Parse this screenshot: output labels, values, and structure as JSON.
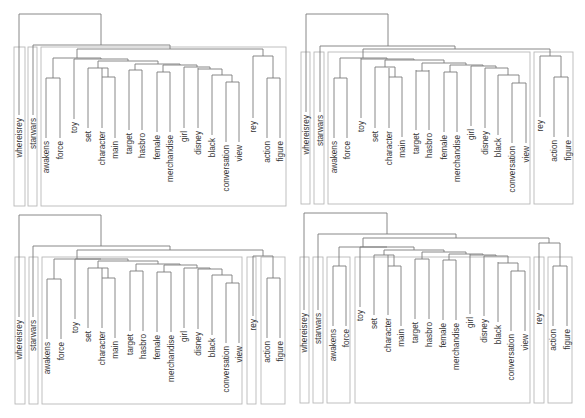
{
  "leaves": [
    "whereisrey",
    "starwars",
    "awakens",
    "force",
    "toy",
    "set",
    "character",
    "main",
    "target",
    "hasbro",
    "female",
    "merchandise",
    "girl",
    "disney",
    "black",
    "conversation",
    "view",
    "rey",
    "action",
    "figure"
  ],
  "colors": {
    "line": "#7a7a7a",
    "box": "#b8b8b8",
    "text": "#333333",
    "background": "#ffffff"
  },
  "panels": [
    {
      "id": "top-left",
      "origin": [
        0,
        0
      ],
      "leaf_x": [
        19,
        33,
        46,
        60,
        74,
        88,
        102,
        115,
        129,
        142,
        157,
        170,
        184,
        198,
        212,
        226,
        239,
        253,
        267,
        280
      ],
      "leaf_label_top": [
        55,
        55,
        78,
        78,
        78,
        78,
        78,
        78,
        78,
        78,
        78,
        78,
        78,
        78,
        78,
        78,
        78,
        78,
        78,
        78
      ],
      "leaf_line_top": [
        55,
        55,
        78,
        78,
        59,
        68,
        68,
        78,
        70,
        70,
        72,
        72,
        68,
        68,
        75,
        82,
        82,
        58,
        78,
        78
      ],
      "merges": [
        {
          "x1": 46,
          "x2": 60,
          "y": 78,
          "cx": 53
        },
        {
          "x1": 102,
          "x2": 115,
          "y": 77,
          "cx": 108
        },
        {
          "x1": 88,
          "x2": 108,
          "y": 68,
          "cx": 98
        },
        {
          "x1": 129,
          "x2": 142,
          "y": 70,
          "cx": 135
        },
        {
          "x1": 157,
          "x2": 170,
          "y": 72,
          "cx": 163
        },
        {
          "x1": 226,
          "x2": 239,
          "y": 82,
          "cx": 232
        },
        {
          "x1": 212,
          "x2": 232,
          "y": 75,
          "cx": 222
        },
        {
          "x1": 198,
          "x2": 222,
          "y": 69,
          "cx": 210
        },
        {
          "x1": 184,
          "x2": 210,
          "y": 67,
          "cx": 197
        },
        {
          "x1": 163,
          "x2": 197,
          "y": 65,
          "cx": 180
        },
        {
          "x1": 135,
          "x2": 180,
          "y": 64,
          "cx": 158
        },
        {
          "x1": 98,
          "x2": 158,
          "y": 61,
          "cx": 128
        },
        {
          "x1": 74,
          "x2": 128,
          "y": 59,
          "cx": 101
        },
        {
          "x1": 53,
          "x2": 101,
          "y": 58,
          "cx": 77
        },
        {
          "x1": 267,
          "x2": 280,
          "y": 78,
          "cx": 273
        },
        {
          "x1": 253,
          "x2": 273,
          "y": 56,
          "cx": 263
        },
        {
          "x1": 77,
          "x2": 263,
          "y": 49,
          "cx": 170
        },
        {
          "x1": 33,
          "x2": 170,
          "y": 45,
          "cx": 101
        },
        {
          "x1": 19,
          "x2": 101,
          "y": 14,
          "cx": 60
        }
      ],
      "boxes": [
        [
          14,
          47,
          25,
          206
        ],
        [
          28,
          47,
          37,
          206
        ],
        [
          41,
          47,
          286,
          206
        ]
      ]
    },
    {
      "id": "top-right",
      "origin": [
        295,
        0
      ],
      "leaf_x": [
        11,
        25,
        39,
        52,
        66,
        80,
        94,
        107,
        121,
        134,
        149,
        162,
        176,
        190,
        203,
        217,
        231,
        245,
        259,
        273
      ],
      "leaf_line_top": [
        52,
        52,
        78,
        78,
        58,
        68,
        68,
        77,
        70,
        70,
        72,
        72,
        66,
        68,
        75,
        83,
        83,
        57,
        77,
        77
      ],
      "merges": [
        {
          "x1": 39,
          "x2": 52,
          "y": 78,
          "cx": 45
        },
        {
          "x1": 94,
          "x2": 107,
          "y": 77,
          "cx": 100
        },
        {
          "x1": 80,
          "x2": 100,
          "y": 67,
          "cx": 90
        },
        {
          "x1": 121,
          "x2": 134,
          "y": 71,
          "cx": 127
        },
        {
          "x1": 149,
          "x2": 162,
          "y": 72,
          "cx": 155
        },
        {
          "x1": 217,
          "x2": 231,
          "y": 83,
          "cx": 224
        },
        {
          "x1": 203,
          "x2": 224,
          "y": 75,
          "cx": 213
        },
        {
          "x1": 190,
          "x2": 213,
          "y": 68,
          "cx": 201
        },
        {
          "x1": 176,
          "x2": 201,
          "y": 66,
          "cx": 188
        },
        {
          "x1": 155,
          "x2": 188,
          "y": 65,
          "cx": 171
        },
        {
          "x1": 127,
          "x2": 171,
          "y": 63,
          "cx": 149
        },
        {
          "x1": 90,
          "x2": 149,
          "y": 60,
          "cx": 119
        },
        {
          "x1": 66,
          "x2": 119,
          "y": 59,
          "cx": 92
        },
        {
          "x1": 45,
          "x2": 92,
          "y": 58,
          "cx": 68
        },
        {
          "x1": 259,
          "x2": 273,
          "y": 77,
          "cx": 266
        },
        {
          "x1": 245,
          "x2": 266,
          "y": 56,
          "cx": 255
        },
        {
          "x1": 68,
          "x2": 255,
          "y": 49,
          "cx": 160
        },
        {
          "x1": 25,
          "x2": 160,
          "y": 46,
          "cx": 93
        },
        {
          "x1": 11,
          "x2": 93,
          "y": 14,
          "cx": 52
        }
      ],
      "boxes": [
        [
          6,
          52,
          15,
          204
        ],
        [
          19,
          52,
          29,
          204
        ],
        [
          33,
          52,
          235,
          204
        ],
        [
          239,
          52,
          278,
          204
        ]
      ]
    },
    {
      "id": "bottom-left",
      "origin": [
        0,
        210
      ],
      "leaf_x": [
        19,
        33,
        47,
        61,
        75,
        88,
        102,
        115,
        130,
        143,
        157,
        171,
        184,
        198,
        212,
        226,
        239,
        253,
        267,
        280
      ],
      "leaf_line_top": [
        47,
        47,
        69,
        69,
        49,
        58,
        58,
        68,
        61,
        61,
        62,
        62,
        58,
        59,
        65,
        73,
        73,
        46,
        68,
        68
      ],
      "merges": [
        {
          "x1": 47,
          "x2": 61,
          "y": 69,
          "cx": 54
        },
        {
          "x1": 102,
          "x2": 115,
          "y": 68,
          "cx": 108
        },
        {
          "x1": 88,
          "x2": 108,
          "y": 58,
          "cx": 98
        },
        {
          "x1": 130,
          "x2": 143,
          "y": 61,
          "cx": 136
        },
        {
          "x1": 157,
          "x2": 171,
          "y": 62,
          "cx": 164
        },
        {
          "x1": 226,
          "x2": 239,
          "y": 73,
          "cx": 232
        },
        {
          "x1": 212,
          "x2": 232,
          "y": 65,
          "cx": 222
        },
        {
          "x1": 198,
          "x2": 222,
          "y": 59,
          "cx": 210
        },
        {
          "x1": 184,
          "x2": 210,
          "y": 58,
          "cx": 197
        },
        {
          "x1": 164,
          "x2": 197,
          "y": 55,
          "cx": 180
        },
        {
          "x1": 136,
          "x2": 180,
          "y": 54,
          "cx": 158
        },
        {
          "x1": 98,
          "x2": 158,
          "y": 51,
          "cx": 128
        },
        {
          "x1": 75,
          "x2": 128,
          "y": 49,
          "cx": 101
        },
        {
          "x1": 54,
          "x2": 101,
          "y": 49,
          "cx": 77
        },
        {
          "x1": 267,
          "x2": 280,
          "y": 68,
          "cx": 273
        },
        {
          "x1": 253,
          "x2": 273,
          "y": 46,
          "cx": 263
        },
        {
          "x1": 77,
          "x2": 263,
          "y": 40,
          "cx": 170
        },
        {
          "x1": 33,
          "x2": 170,
          "y": 36,
          "cx": 101
        },
        {
          "x1": 19,
          "x2": 101,
          "y": 5,
          "cx": 60
        }
      ],
      "boxes": [
        [
          15,
          47,
          25,
          194
        ],
        [
          29,
          47,
          38,
          194
        ],
        [
          42,
          47,
          242,
          194
        ],
        [
          247,
          47,
          256,
          194
        ],
        [
          261,
          47,
          285,
          194
        ]
      ]
    },
    {
      "id": "bottom-right",
      "origin": [
        295,
        210
      ],
      "leaf_x": [
        9,
        23,
        38,
        51,
        65,
        79,
        93,
        106,
        120,
        134,
        148,
        161,
        175,
        189,
        203,
        216,
        230,
        244,
        258,
        272
      ],
      "leaf_line_top": [
        40,
        40,
        56,
        56,
        37,
        45,
        45,
        56,
        49,
        49,
        50,
        50,
        44,
        46,
        52,
        61,
        61,
        40,
        56,
        56
      ],
      "merges": [
        {
          "x1": 38,
          "x2": 51,
          "y": 56,
          "cx": 44
        },
        {
          "x1": 93,
          "x2": 106,
          "y": 56,
          "cx": 99
        },
        {
          "x1": 79,
          "x2": 99,
          "y": 45,
          "cx": 89
        },
        {
          "x1": 120,
          "x2": 134,
          "y": 49,
          "cx": 127
        },
        {
          "x1": 148,
          "x2": 161,
          "y": 50,
          "cx": 154
        },
        {
          "x1": 216,
          "x2": 230,
          "y": 61,
          "cx": 223
        },
        {
          "x1": 203,
          "x2": 223,
          "y": 53,
          "cx": 213
        },
        {
          "x1": 189,
          "x2": 213,
          "y": 46,
          "cx": 201
        },
        {
          "x1": 175,
          "x2": 201,
          "y": 45,
          "cx": 188
        },
        {
          "x1": 154,
          "x2": 188,
          "y": 44,
          "cx": 171
        },
        {
          "x1": 127,
          "x2": 171,
          "y": 42,
          "cx": 149
        },
        {
          "x1": 89,
          "x2": 149,
          "y": 40,
          "cx": 119
        },
        {
          "x1": 65,
          "x2": 119,
          "y": 37,
          "cx": 92
        },
        {
          "x1": 44,
          "x2": 92,
          "y": 37,
          "cx": 68
        },
        {
          "x1": 258,
          "x2": 272,
          "y": 56,
          "cx": 265
        },
        {
          "x1": 244,
          "x2": 265,
          "y": 33,
          "cx": 254
        },
        {
          "x1": 68,
          "x2": 254,
          "y": 28,
          "cx": 161
        },
        {
          "x1": 23,
          "x2": 161,
          "y": 24,
          "cx": 92
        },
        {
          "x1": 9,
          "x2": 92,
          "y": 3,
          "cx": 51
        }
      ],
      "boxes": [
        [
          5,
          47,
          14,
          193
        ],
        [
          18,
          47,
          28,
          193
        ],
        [
          32,
          47,
          55,
          193
        ],
        [
          60,
          47,
          235,
          193
        ],
        [
          239,
          47,
          249,
          193
        ],
        [
          253,
          47,
          277,
          193
        ]
      ]
    }
  ],
  "label_offsets": {
    "whereisrey": 55,
    "starwars": 55,
    "awakens": 78,
    "force": 78,
    "toy": 58,
    "set": 68,
    "character": 78,
    "main": 78,
    "target": 70,
    "hasbro": 70,
    "female": 72,
    "merchandise": 72,
    "girl": 68,
    "disney": 68,
    "black": 75,
    "conversation": 82,
    "view": 82,
    "rey": 57,
    "action": 78,
    "figure": 78
  }
}
